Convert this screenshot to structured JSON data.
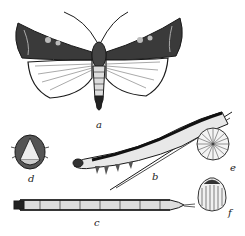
{
  "figure": {
    "colors": {
      "ink": "#1a1a1a",
      "paper": "#ffffff"
    },
    "panels": [
      {
        "id": "a",
        "label": "a",
        "subject": "adult moth, wings spread"
      },
      {
        "id": "b",
        "label": "b",
        "subject": "larva on grass stem, side view"
      },
      {
        "id": "c",
        "label": "c",
        "subject": "larva, dorsal view"
      },
      {
        "id": "d",
        "label": "d",
        "subject": "larva head, front view"
      },
      {
        "id": "e",
        "label": "e",
        "subject": "egg, top view"
      },
      {
        "id": "f",
        "label": "f",
        "subject": "egg, side view"
      }
    ]
  }
}
